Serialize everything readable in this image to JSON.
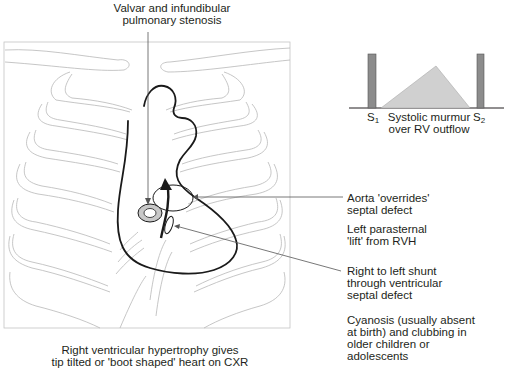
{
  "title_label": {
    "line1": "Valvar and infundibular",
    "line2": "pulmonary stenosis"
  },
  "murmur_diagram": {
    "s1_label": "S",
    "s1_sub": "1",
    "s2_label": "S",
    "s2_sub": "2",
    "caption_line1": "Systolic murmur",
    "caption_line2": "over RV outflow",
    "colors": {
      "bar": "#8c8c8c",
      "murmur_fill": "#d0d0d0",
      "baseline": "#231f20"
    }
  },
  "annotations": [
    {
      "line1": "Aorta 'overrides'",
      "line2": "septal defect"
    },
    {
      "line1": "Left parasternal",
      "line2": "'lift' from RVH"
    },
    {
      "line1": "Right to left shunt",
      "line2": "through ventricular",
      "line3": "septal defect"
    },
    {
      "line1": "Cyanosis (usually absent",
      "line2": "at birth) and clubbing in",
      "line3": "older children or",
      "line4": "adolescents"
    }
  ],
  "bottom_caption": {
    "line1": "Right ventricular hypertrophy gives",
    "line2": "tip tilted or 'boot shaped' heart on CXR"
  },
  "colors": {
    "rib_outline": "#b8b8b8",
    "heart_outline": "#1a1a1a",
    "leader_line": "#555555",
    "valve_fill": "#c8c8c8"
  }
}
